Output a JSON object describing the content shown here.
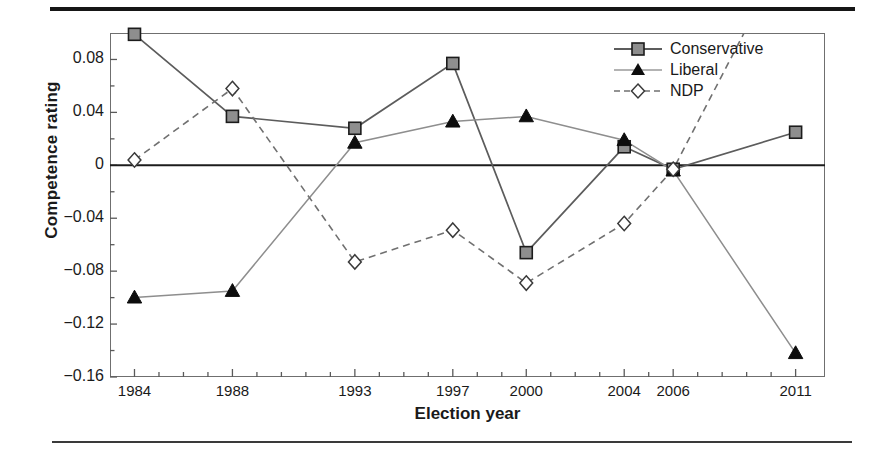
{
  "figure": {
    "has_top_rule": true,
    "has_bottom_rule": true
  },
  "axes": {
    "ylabel": "Competence rating",
    "xlabel": "Election year",
    "ytick_labels": [
      "0.08",
      "0.04",
      "0",
      "−0.04",
      "−0.08",
      "−0.12",
      "−0.16"
    ],
    "xtick_labels": [
      "1984",
      "1988",
      "1993",
      "1997",
      "2000",
      "2004",
      "2006",
      "2011"
    ]
  },
  "legend": {
    "entries": [
      {
        "label": "Conservative",
        "marker": "filled-square-marker",
        "line": "solid",
        "color": "#8c8c8c"
      },
      {
        "label": "Liberal",
        "marker": "filled-triangle-marker",
        "line": "solid-thin",
        "color": "#111111"
      },
      {
        "label": "NDP",
        "marker": "open-diamond-marker",
        "line": "dashed",
        "color": "#3a3a3a"
      }
    ]
  },
  "chart_data": {
    "type": "line",
    "title": "",
    "xlabel": "Election year",
    "ylabel": "Competence rating",
    "categories": [
      "1984",
      "1988",
      "1993",
      "1997",
      "2000",
      "2004",
      "2006",
      "2011"
    ],
    "x": [
      1984,
      1988,
      1993,
      1997,
      2000,
      2004,
      2006,
      2011
    ],
    "xlim": [
      1983.0,
      2012.2
    ],
    "ylim": [
      -0.16,
      0.1
    ],
    "yticks": [
      0.08,
      0.04,
      0,
      -0.04,
      -0.08,
      -0.12,
      -0.16
    ],
    "grid": false,
    "zero_line": true,
    "legend_position": "top-right",
    "series": [
      {
        "name": "Conservative",
        "marker": "filled-square",
        "linestyle": "solid",
        "color": "#8c8c8c",
        "values": [
          0.099,
          0.037,
          0.028,
          0.077,
          -0.066,
          0.014,
          -0.003,
          0.025
        ]
      },
      {
        "name": "Liberal",
        "marker": "filled-triangle",
        "linestyle": "solid",
        "color": "#111111",
        "values": [
          -0.1,
          -0.095,
          0.017,
          0.033,
          0.037,
          0.019,
          -0.004,
          -0.142
        ]
      },
      {
        "name": "NDP",
        "marker": "open-diamond",
        "linestyle": "dashed",
        "color": "#3a3a3a",
        "values": [
          0.004,
          0.058,
          -0.073,
          -0.049,
          -0.089,
          -0.044,
          -0.003,
          0.175
        ],
        "note": "2011 value extends above the top of the plot area (line clipped at axis boundary)"
      }
    ]
  }
}
